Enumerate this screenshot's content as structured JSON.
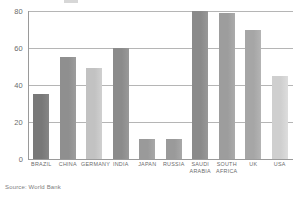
{
  "figure": {
    "source_note": "Source: World Bank"
  },
  "chart_data": {
    "type": "bar",
    "title": "",
    "subtitle": "",
    "xlabel": "",
    "ylabel": "",
    "ylim": [
      0,
      80
    ],
    "yticks": [
      0,
      20,
      40,
      60,
      80
    ],
    "ytick_labels": [
      "0",
      "20",
      "40",
      "60",
      "80"
    ],
    "grid": true,
    "legend": "none",
    "categories": [
      "BRAZIL",
      "CHINA",
      "GERMANY",
      "INDIA",
      "JAPAN",
      "RUSSIA",
      "SAUDI\nARABIA",
      "SOUTH\nAFRICA",
      "UK",
      "USA"
    ],
    "values": [
      35,
      55,
      49,
      60,
      11,
      11,
      80,
      79,
      70,
      45
    ],
    "bar_colors": [
      "#787878",
      "#8f8f8f",
      "#c2c2c2",
      "#8b8b8b",
      "#9a9a9a",
      "#9a9a9a",
      "#8a8a8a",
      "#9d9d9d",
      "#a6a6a6",
      "#cfcfcf"
    ],
    "axis_color": "#9a9a9a",
    "grid_color": "#b5b5b5",
    "text_color": "#6b6b6b",
    "background": "#ffffff"
  }
}
